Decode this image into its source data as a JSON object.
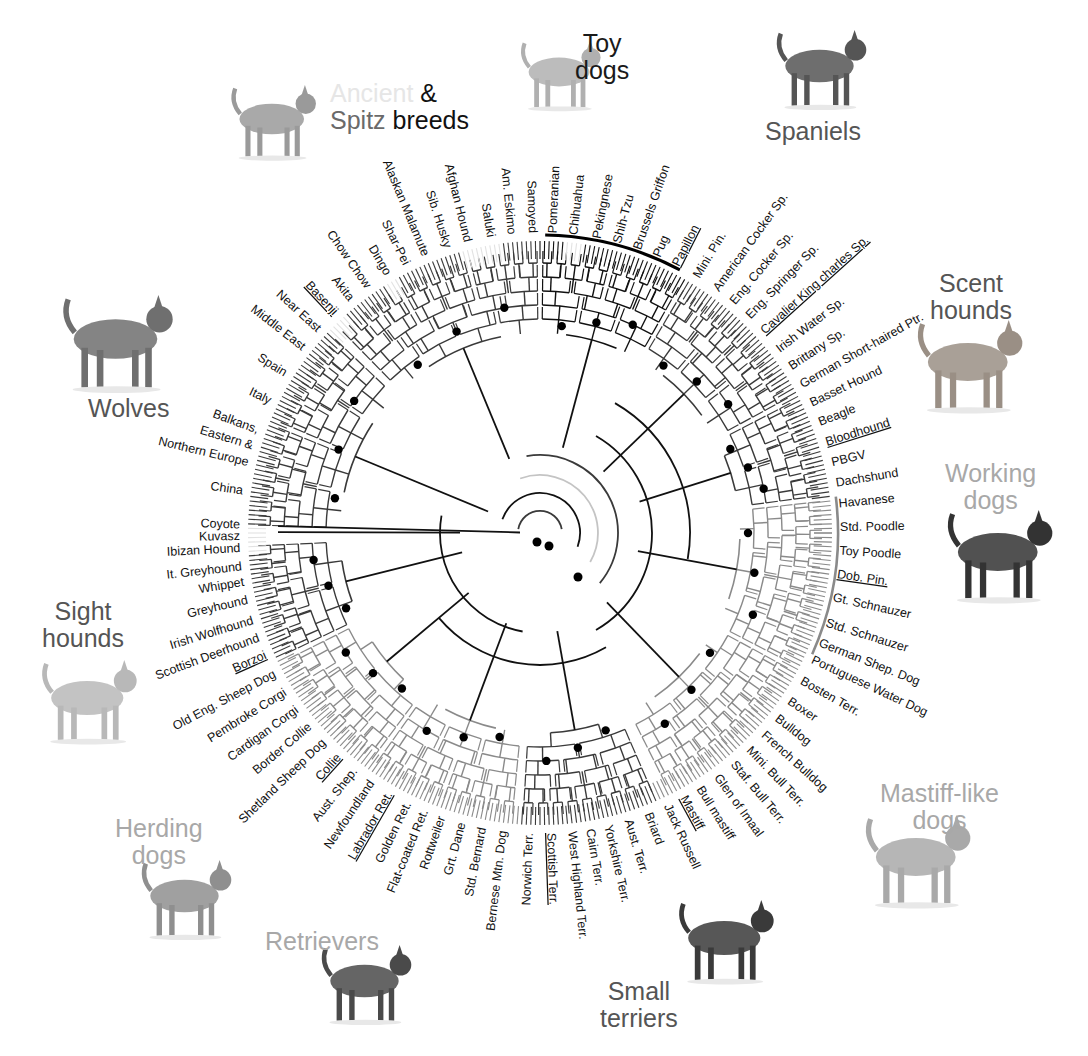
{
  "figure": {
    "center": [
      540,
      533
    ],
    "leaf_radius": 292,
    "label_radius": 300,
    "label_font_size": 12.5
  },
  "colors": {
    "black": "#111111",
    "dark": "#3a3a3a",
    "mid": "#8a8a8a",
    "light": "#c4c4c4",
    "pale": "#e2e2e2"
  },
  "groups": [
    {
      "id": "ancient-spitz",
      "title_parts": [
        {
          "text": "Ancient",
          "color": "#e6e6e6"
        },
        {
          "text": " &",
          "color": "#111111"
        }
      ],
      "title_line2_parts": [
        {
          "text": "Spitz",
          "color": "#6a6a6a"
        },
        {
          "text": " breeds",
          "color": "#111111"
        }
      ],
      "x": 330,
      "y": 80,
      "dog": "basenji"
    },
    {
      "id": "toy",
      "title": "Toy\ndogs",
      "color": "#1a1a1a",
      "x": 575,
      "y": 30,
      "dog": "papillon"
    },
    {
      "id": "spaniels",
      "title": "Spaniels",
      "color": "#555555",
      "x": 765,
      "y": 118,
      "dog": "springer"
    },
    {
      "id": "scent-hounds",
      "title": "Scent\nhounds",
      "color": "#555555",
      "x": 930,
      "y": 270,
      "dog": "bloodhound"
    },
    {
      "id": "working",
      "title": "Working\ndogs",
      "color": "#a8a8a8",
      "x": 945,
      "y": 460,
      "dog": "doberman"
    },
    {
      "id": "mastiff-like",
      "title": "Mastiff-like\ndogs",
      "color": "#a8a8a8",
      "x": 880,
      "y": 780,
      "dog": "mastiff"
    },
    {
      "id": "small-terriers",
      "title": "Small\nterriers",
      "color": "#555555",
      "x": 600,
      "y": 978,
      "dog": "scottie"
    },
    {
      "id": "retrievers",
      "title": "Retrievers",
      "color": "#a8a8a8",
      "x": 265,
      "y": 928,
      "dog": "labrador"
    },
    {
      "id": "herding",
      "title": "Herding\ndogs",
      "color": "#a8a8a8",
      "x": 115,
      "y": 815,
      "dog": "collie"
    },
    {
      "id": "sight-hounds",
      "title": "Sight\nhounds",
      "color": "#555555",
      "x": 42,
      "y": 598,
      "dog": "borzoi"
    },
    {
      "id": "wolves",
      "title": "Wolves",
      "color": "#555555",
      "x": 88,
      "y": 395,
      "dog": "wolf"
    }
  ],
  "leaves": [
    {
      "label": "Coyote",
      "angle": 181.5,
      "shade": "black",
      "underline": false
    },
    {
      "label": "China",
      "angle": 188.0,
      "shade": "dark",
      "underline": false
    },
    {
      "label": "Northern Europe",
      "angle": 193.5,
      "shade": "dark",
      "underline": false
    },
    {
      "label": "Eastern &",
      "angle": 196.8,
      "shade": "dark",
      "underline": false
    },
    {
      "label": "Balkans,",
      "angle": 200.0,
      "shade": "dark",
      "underline": false
    },
    {
      "label": "Italy",
      "angle": 206.0,
      "shade": "dark",
      "underline": false
    },
    {
      "label": "Spain",
      "angle": 212.0,
      "shade": "dark",
      "underline": false
    },
    {
      "label": "Middle East",
      "angle": 218.0,
      "shade": "dark",
      "underline": false
    },
    {
      "label": "Near East",
      "angle": 222.5,
      "shade": "dark",
      "underline": false
    },
    {
      "label": "Basenji",
      "angle": 227.0,
      "shade": "pale",
      "underline": true
    },
    {
      "label": "Akita",
      "angle": 231.0,
      "shade": "dark",
      "underline": false
    },
    {
      "label": "Chow Chow",
      "angle": 235.0,
      "shade": "dark",
      "underline": false
    },
    {
      "label": "Dingo",
      "angle": 239.5,
      "shade": "pale",
      "underline": false
    },
    {
      "label": "Shar-Pei",
      "angle": 243.5,
      "shade": "dark",
      "underline": false
    },
    {
      "label": "Alaskan Malamute",
      "angle": 247.5,
      "shade": "dark",
      "underline": false
    },
    {
      "label": "Sib. Husky",
      "angle": 252.0,
      "shade": "dark",
      "underline": false
    },
    {
      "label": "Afghan Hound",
      "angle": 256.0,
      "shade": "pale",
      "underline": false
    },
    {
      "label": "Saluki",
      "angle": 260.5,
      "shade": "pale",
      "underline": false
    },
    {
      "label": "Am. Eskimo",
      "angle": 264.5,
      "shade": "dark",
      "underline": false
    },
    {
      "label": "Samoyed",
      "angle": 268.5,
      "shade": "dark",
      "underline": false
    },
    {
      "label": "Pomeranian",
      "angle": 272.5,
      "shade": "dark",
      "underline": false
    },
    {
      "label": "Chihuahua",
      "angle": 276.5,
      "shade": "pale",
      "underline": false
    },
    {
      "label": "Pekingnese",
      "angle": 281.0,
      "shade": "black",
      "underline": false
    },
    {
      "label": "Shih-Tzu",
      "angle": 285.0,
      "shade": "black",
      "underline": false
    },
    {
      "label": "Brussels Griffon",
      "angle": 289.0,
      "shade": "dark",
      "underline": false
    },
    {
      "label": "Pug",
      "angle": 293.0,
      "shade": "light",
      "underline": false
    },
    {
      "label": "Papillon",
      "angle": 297.0,
      "shade": "dark",
      "underline": true
    },
    {
      "label": "Mini. Pin.",
      "angle": 301.5,
      "shade": "dark",
      "underline": false
    },
    {
      "label": "American Cocker Sp.",
      "angle": 306.0,
      "shade": "dark",
      "underline": false
    },
    {
      "label": "Eng. Cocker Sp.",
      "angle": 310.0,
      "shade": "dark",
      "underline": false
    },
    {
      "label": "Eng. Springer Sp.",
      "angle": 314.0,
      "shade": "dark",
      "underline": false
    },
    {
      "label": "Cavalier King charles Sp.",
      "angle": 318.0,
      "shade": "dark",
      "underline": true
    },
    {
      "label": "Irish Water Sp.",
      "angle": 322.5,
      "shade": "dark",
      "underline": false
    },
    {
      "label": "Brittany Sp.",
      "angle": 326.5,
      "shade": "dark",
      "underline": false
    },
    {
      "label": "German Short-haired Ptr.",
      "angle": 330.5,
      "shade": "dark",
      "underline": false
    },
    {
      "label": "Basset Hound",
      "angle": 334.5,
      "shade": "dark",
      "underline": false
    },
    {
      "label": "Beagle",
      "angle": 338.5,
      "shade": "dark",
      "underline": false
    },
    {
      "label": "Bloodhound",
      "angle": 342.5,
      "shade": "dark",
      "underline": true
    },
    {
      "label": "PBGV",
      "angle": 346.5,
      "shade": "dark",
      "underline": false
    },
    {
      "label": "Dachshund",
      "angle": 350.5,
      "shade": "dark",
      "underline": false
    },
    {
      "label": "Havanese",
      "angle": 354.5,
      "shade": "mid",
      "underline": false
    },
    {
      "label": "Std. Poodle",
      "angle": 359.0,
      "shade": "mid",
      "underline": false
    },
    {
      "label": "Toy Poodle",
      "angle": 3.5,
      "shade": "mid",
      "underline": false
    },
    {
      "label": "Dob. Pin.",
      "angle": 8.0,
      "shade": "mid",
      "underline": true
    },
    {
      "label": "Gt. Schnauzer",
      "angle": 12.5,
      "shade": "mid",
      "underline": false
    },
    {
      "label": "Std. Schnauzer",
      "angle": 17.5,
      "shade": "mid",
      "underline": false
    },
    {
      "label": "German Shep. Dog",
      "angle": 21.5,
      "shade": "dark",
      "underline": false
    },
    {
      "label": "Portuguese Water Dog",
      "angle": 25.0,
      "shade": "mid",
      "underline": false
    },
    {
      "label": "Bosten Terr.",
      "angle": 29.5,
      "shade": "mid",
      "underline": false
    },
    {
      "label": "Boxer",
      "angle": 34.0,
      "shade": "mid",
      "underline": false
    },
    {
      "label": "Bulldog",
      "angle": 38.0,
      "shade": "mid",
      "underline": false
    },
    {
      "label": "French Bulldog",
      "angle": 42.0,
      "shade": "mid",
      "underline": false
    },
    {
      "label": "Mini. Bull Terr.",
      "angle": 46.0,
      "shade": "mid",
      "underline": false
    },
    {
      "label": "Staf. Bull Terr.",
      "angle": 50.0,
      "shade": "mid",
      "underline": false
    },
    {
      "label": "Glen of Imaal",
      "angle": 54.0,
      "shade": "dark",
      "underline": false
    },
    {
      "label": "Bull mastiff",
      "angle": 58.0,
      "shade": "mid",
      "underline": false
    },
    {
      "label": "Mastiff",
      "angle": 61.5,
      "shade": "mid",
      "underline": true
    },
    {
      "label": "Jack Russell",
      "angle": 65.0,
      "shade": "mid",
      "underline": false
    },
    {
      "label": "Briard",
      "angle": 69.0,
      "shade": "dark",
      "underline": false
    },
    {
      "label": "Aust. Terr.",
      "angle": 73.0,
      "shade": "dark",
      "underline": false
    },
    {
      "label": "Yorkshire Terr.",
      "angle": 77.0,
      "shade": "dark",
      "underline": false
    },
    {
      "label": "Cairn Terr.",
      "angle": 80.5,
      "shade": "dark",
      "underline": false
    },
    {
      "label": "West Highland Terr.",
      "angle": 84.0,
      "shade": "dark",
      "underline": false
    },
    {
      "label": "Scottish Terr.",
      "angle": 88.0,
      "shade": "dark",
      "underline": true
    },
    {
      "label": "Norwich Terr.",
      "angle": 92.0,
      "shade": "dark",
      "underline": false
    },
    {
      "label": "Bernese Mtn. Dog",
      "angle": 97.0,
      "shade": "mid",
      "underline": false
    },
    {
      "label": "Std. Bernard",
      "angle": 101.0,
      "shade": "mid",
      "underline": false
    },
    {
      "label": "Grt. Dane",
      "angle": 105.0,
      "shade": "mid",
      "underline": false
    },
    {
      "label": "Rottweiler",
      "angle": 109.0,
      "shade": "mid",
      "underline": false
    },
    {
      "label": "Flat-coated Ret.",
      "angle": 112.5,
      "shade": "mid",
      "underline": false
    },
    {
      "label": "Golden Ret.",
      "angle": 116.0,
      "shade": "mid",
      "underline": false
    },
    {
      "label": "Labrador Ret.",
      "angle": 120.0,
      "shade": "mid",
      "underline": true
    },
    {
      "label": "Newfoundland",
      "angle": 124.0,
      "shade": "mid",
      "underline": false
    },
    {
      "label": "Aust. Shep.",
      "angle": 128.0,
      "shade": "mid",
      "underline": false
    },
    {
      "label": "Collie",
      "angle": 132.0,
      "shade": "mid",
      "underline": true
    },
    {
      "label": "Shetland Sheep Dog",
      "angle": 136.0,
      "shade": "mid",
      "underline": false
    },
    {
      "label": "Border Collie",
      "angle": 140.0,
      "shade": "mid",
      "underline": false
    },
    {
      "label": "Cardigan Corgi",
      "angle": 144.0,
      "shade": "mid",
      "underline": false
    },
    {
      "label": "Pembroke Corgi",
      "angle": 148.0,
      "shade": "mid",
      "underline": false
    },
    {
      "label": "Old Eng. Sheep Dog",
      "angle": 152.0,
      "shade": "mid",
      "underline": false
    },
    {
      "label": "Borzoi",
      "angle": 156.0,
      "shade": "dark",
      "underline": true
    },
    {
      "label": "Scottish Deerhound",
      "angle": 159.5,
      "shade": "dark",
      "underline": false
    },
    {
      "label": "Irish Wolfhound",
      "angle": 163.0,
      "shade": "dark",
      "underline": false
    },
    {
      "label": "Greyhound",
      "angle": 167.0,
      "shade": "dark",
      "underline": false
    },
    {
      "label": "Whippet",
      "angle": 170.5,
      "shade": "dark",
      "underline": false
    },
    {
      "label": "It. Greyhound",
      "angle": 173.5,
      "shade": "dark",
      "underline": false
    },
    {
      "label": "Ibizan Hound",
      "angle": 177.0,
      "shade": "pale",
      "underline": false
    },
    {
      "label": "Kuvasz",
      "angle": 179.3,
      "shade": "pale",
      "underline": false
    }
  ],
  "clades": [
    {
      "name": "wolves",
      "from": 181,
      "to": 224,
      "shade": "dark",
      "depth": 0.35
    },
    {
      "name": "ancient-spitz",
      "from": 225,
      "to": 270,
      "shade": "dark",
      "depth": 0.5
    },
    {
      "name": "toy",
      "from": 270,
      "to": 300,
      "shade": "black",
      "depth": 0.55
    },
    {
      "name": "spaniels",
      "from": 300,
      "to": 332,
      "shade": "dark",
      "depth": 0.55
    },
    {
      "name": "scent-hounds",
      "from": 332,
      "to": 353,
      "shade": "dark",
      "depth": 0.65
    },
    {
      "name": "working",
      "from": 353,
      "to": 388,
      "shade": "mid",
      "depth": 0.62
    },
    {
      "name": "mastiff",
      "from": 28,
      "to": 64,
      "shade": "mid",
      "depth": 0.6
    },
    {
      "name": "terriers",
      "from": 66,
      "to": 94,
      "shade": "dark",
      "depth": 0.62
    },
    {
      "name": "retrievers",
      "from": 95,
      "to": 126,
      "shade": "mid",
      "depth": 0.6
    },
    {
      "name": "herding",
      "from": 126,
      "to": 154,
      "shade": "mid",
      "depth": 0.58
    },
    {
      "name": "sight-hounds",
      "from": 154,
      "to": 178,
      "shade": "dark",
      "depth": 0.5
    }
  ],
  "toy_arc": {
    "from": 271,
    "to": 298
  }
}
